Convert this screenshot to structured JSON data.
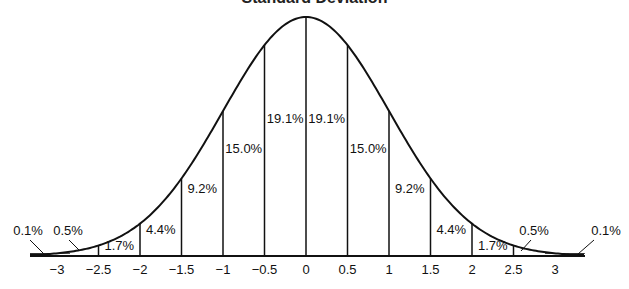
{
  "chart_data": {
    "type": "area",
    "title": "Standard Deviation",
    "xlabel": "",
    "ylabel": "",
    "x_ticks": [
      "−3",
      "−2.5",
      "−2",
      "−1.5",
      "−1",
      "−0.5",
      "0",
      "0.5",
      "1",
      "1.5",
      "2",
      "2.5",
      "3"
    ],
    "x_values": [
      -3,
      -2.5,
      -2,
      -1.5,
      -1,
      -0.5,
      0,
      0.5,
      1,
      1.5,
      2,
      2.5,
      3
    ],
    "xlim": [
      -3.5,
      3.5
    ],
    "grid": false,
    "legend": null,
    "segments": [
      {
        "from": "-inf",
        "to": -3,
        "percent": "0.1%"
      },
      {
        "from": -3,
        "to": -2.5,
        "percent": "0.5%"
      },
      {
        "from": -2.5,
        "to": -2,
        "percent": "1.7%"
      },
      {
        "from": -2,
        "to": -1.5,
        "percent": "4.4%"
      },
      {
        "from": -1.5,
        "to": -1,
        "percent": "9.2%"
      },
      {
        "from": -1,
        "to": -0.5,
        "percent": "15.0%"
      },
      {
        "from": -0.5,
        "to": 0,
        "percent": "19.1%"
      },
      {
        "from": 0,
        "to": 0.5,
        "percent": "19.1%"
      },
      {
        "from": 0.5,
        "to": 1,
        "percent": "15.0%"
      },
      {
        "from": 1,
        "to": 1.5,
        "percent": "9.2%"
      },
      {
        "from": 1.5,
        "to": 2,
        "percent": "4.4%"
      },
      {
        "from": 2,
        "to": 2.5,
        "percent": "1.7%"
      },
      {
        "from": 2.5,
        "to": 3,
        "percent": "0.5%"
      },
      {
        "from": 3,
        "to": "inf",
        "percent": "0.1%"
      }
    ]
  }
}
